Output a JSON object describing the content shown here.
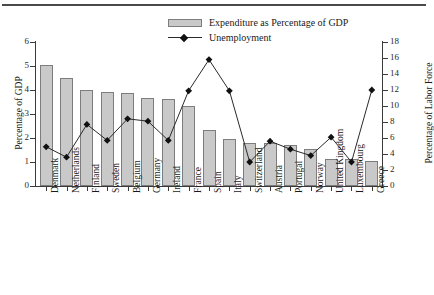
{
  "chart_data": {
    "type": "bar",
    "title": "",
    "subtitle": "",
    "xlabel": "",
    "ylabel": "Percentage of GDP",
    "y2label": "Percentage of Labor Force",
    "ylim": [
      0,
      6
    ],
    "y2lim": [
      0,
      18
    ],
    "yticks": [
      0,
      1,
      2,
      3,
      4,
      5,
      6
    ],
    "y2ticks": [
      0,
      2,
      4,
      6,
      8,
      10,
      12,
      14,
      16,
      18
    ],
    "grid": false,
    "legend_position": "top-center",
    "categories": [
      "Denmark",
      "Netherlands",
      "Finland",
      "Sweden",
      "Belgium",
      "Germany",
      "Ireland",
      "France",
      "Spain",
      "Italy",
      "Switzerland",
      "Austria",
      "Portugal",
      "Norway",
      "United Kingdom",
      "Luxembourg",
      "Greece"
    ],
    "series": [
      {
        "name": "Expenditure as Percentage of GDP",
        "type": "bar",
        "axis": "left",
        "units": "% of GDP",
        "color": "#c9c9c9",
        "edge_color": "#7d7d7d",
        "values": [
          5.05,
          4.5,
          4.0,
          3.92,
          3.87,
          3.67,
          3.62,
          3.33,
          2.33,
          1.96,
          1.79,
          1.79,
          1.71,
          1.54,
          1.12,
          1.12,
          1.04
        ]
      },
      {
        "name": "Unemployment",
        "type": "line",
        "axis": "right",
        "units": "% of labor force",
        "color": "#2a2a2a",
        "marker": "diamond",
        "values": [
          4.9,
          3.6,
          7.7,
          5.7,
          8.4,
          8.1,
          5.7,
          11.9,
          15.8,
          11.9,
          3.0,
          5.6,
          4.6,
          3.8,
          6.1,
          3.0,
          12.0
        ]
      }
    ]
  },
  "legend": {
    "entries": [
      {
        "label": "Expenditure as Percentage of GDP",
        "icon": "bar-swatch"
      },
      {
        "label": "Unemployment",
        "icon": "line-diamond-marker"
      }
    ]
  }
}
